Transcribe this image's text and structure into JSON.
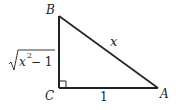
{
  "diagram": {
    "type": "right-triangle",
    "vertices": {
      "B": {
        "label": "B",
        "x": 59,
        "y": 16
      },
      "C": {
        "label": "C",
        "x": 59,
        "y": 88
      },
      "A": {
        "label": "A",
        "x": 158,
        "y": 88
      }
    },
    "sides": {
      "hypotenuse": {
        "from": "B",
        "to": "A",
        "label": "x"
      },
      "vertical_leg": {
        "from": "B",
        "to": "C",
        "label_radicand_base": "x",
        "label_exponent": "2",
        "label_rest": " − 1"
      },
      "horizontal_leg": {
        "from": "C",
        "to": "A",
        "label": "1"
      }
    },
    "right_angle_at": "C",
    "line_color": "#222222"
  }
}
